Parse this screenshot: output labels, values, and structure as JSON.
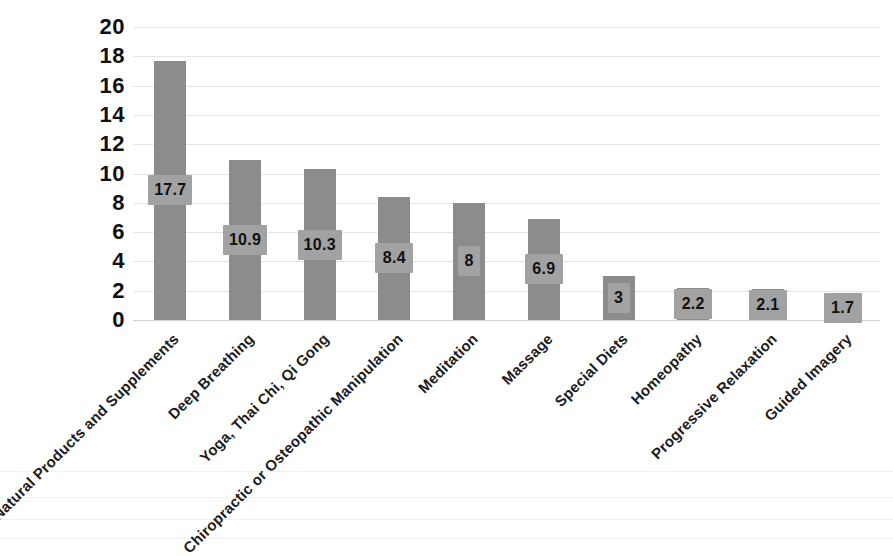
{
  "chart_data": {
    "type": "bar",
    "title": "",
    "subtitle": "",
    "xlabel": "",
    "ylabel": "",
    "ylim": [
      0,
      20
    ],
    "ytick_step": 2,
    "yticks": [
      "20",
      "18",
      "16",
      "14",
      "12",
      "10",
      "8",
      "6",
      "4",
      "2",
      "0"
    ],
    "grid": true,
    "legend": false,
    "orientation": "vertical",
    "bar_color": "#8c8c8c",
    "label_box_color": "#a2a2a2",
    "gridline_color": "#e4e4e4",
    "categories": [
      "Natural Products and Supplements",
      "Deep Breathing",
      "Yoga, Thai Chi, Qi Gong",
      "Chiropractic or Osteopathic Manipulation",
      "Meditation",
      "Massage",
      "Special Diets",
      "Homeopathy",
      "Progressive Relaxation",
      "Guided Imagery"
    ],
    "values": [
      17.7,
      10.9,
      10.3,
      8.4,
      8,
      6.9,
      3,
      2.2,
      2.1,
      1.7
    ],
    "data_labels": [
      "17.7",
      "10.9",
      "10.3",
      "8.4",
      "8",
      "6.9",
      "3",
      "2.2",
      "2.1",
      "1.7"
    ]
  }
}
